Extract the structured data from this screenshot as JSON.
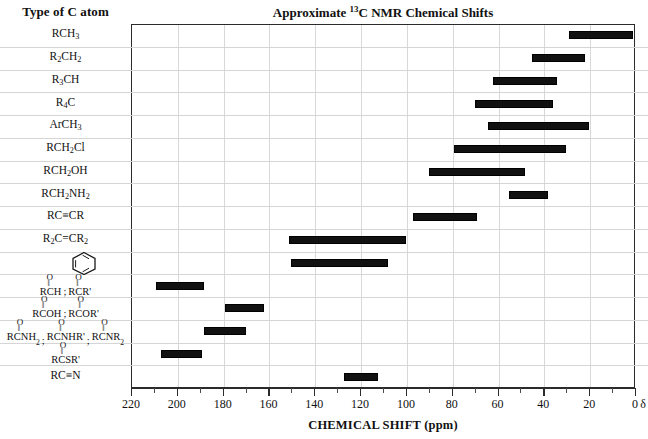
{
  "header": {
    "left_column_title": "Type of C atom",
    "chart_title_pre": "Approximate ",
    "chart_title_sup": "13",
    "chart_title_post": "C NMR Chemical Shifts"
  },
  "axis": {
    "title": "CHEMICAL SHIFT (ppm)",
    "delta_symbol": "δ",
    "major_ticks": [
      220,
      200,
      180,
      160,
      140,
      120,
      100,
      80,
      60,
      40,
      20,
      0
    ],
    "minor_ticks": [
      210,
      190,
      170,
      150,
      130,
      110,
      90,
      70,
      50,
      30,
      10
    ],
    "min": 0,
    "max": 220,
    "reversed": true
  },
  "colors": {
    "bar": "#111111",
    "frame": "#2b2b2b",
    "grid": "#d8d8d8",
    "rowline": "#d5d5d5",
    "background": "#ffffff"
  },
  "chart_data": {
    "type": "bar",
    "title": "Approximate 13C NMR Chemical Shifts",
    "xlabel": "CHEMICAL SHIFT (ppm)",
    "ylabel": "Type of C atom",
    "xlim": [
      220,
      0
    ],
    "grid": true,
    "orientation": "horizontal-ranges",
    "note": "Each row is a horizontal range bar spanning a chemical-shift interval in ppm",
    "categories": [
      "RCH3",
      "R2CH2",
      "R3CH",
      "R4C",
      "ArCH3",
      "RCH2Cl",
      "RCH2OH",
      "RCH2NH2",
      "RC≡CR",
      "R2C=CR2",
      "benzene-ring",
      "RCHO / RCOR' (aldehyde, ketone)",
      "RCOOH / RCOOR' (acid, ester)",
      "RCONH2 / RCONHR' / RCONR2 (amide)",
      "RCOSR' (thioester)",
      "RC≡N"
    ],
    "ranges": [
      {
        "label": "RCH3",
        "from": 1,
        "to": 29
      },
      {
        "label": "R2CH2",
        "from": 22,
        "to": 45
      },
      {
        "label": "R3CH",
        "from": 34,
        "to": 62
      },
      {
        "label": "R4C",
        "from": 36,
        "to": 70
      },
      {
        "label": "ArCH3",
        "from": 20,
        "to": 64
      },
      {
        "label": "RCH2Cl",
        "from": 30,
        "to": 79
      },
      {
        "label": "RCH2OH",
        "from": 48,
        "to": 90
      },
      {
        "label": "RCH2NH2",
        "from": 38,
        "to": 55
      },
      {
        "label": "RC≡CR",
        "from": 69,
        "to": 97
      },
      {
        "label": "R2C=CR2",
        "from": 100,
        "to": 151
      },
      {
        "label": "benzene-ring",
        "from": 108,
        "to": 150
      },
      {
        "label": "aldehyde-ketone",
        "from": 188,
        "to": 209
      },
      {
        "label": "acid-ester",
        "from": 162,
        "to": 179
      },
      {
        "label": "amide",
        "from": 170,
        "to": 188
      },
      {
        "label": "thioester",
        "from": 189,
        "to": 207
      },
      {
        "label": "nitrile",
        "from": 112,
        "to": 127
      }
    ]
  },
  "rows": [
    {
      "name": "rch3",
      "kind": "simple",
      "parts": [
        {
          "t": "RCH"
        },
        {
          "t": "3",
          "sub": true
        }
      ]
    },
    {
      "name": "r2ch2",
      "kind": "simple",
      "parts": [
        {
          "t": "R"
        },
        {
          "t": "2",
          "sub": true
        },
        {
          "t": "CH"
        },
        {
          "t": "2",
          "sub": true
        }
      ]
    },
    {
      "name": "r3ch",
      "kind": "simple",
      "parts": [
        {
          "t": "R"
        },
        {
          "t": "3",
          "sub": true
        },
        {
          "t": "CH"
        }
      ]
    },
    {
      "name": "r4c",
      "kind": "simple",
      "parts": [
        {
          "t": "R"
        },
        {
          "t": "4",
          "sub": true
        },
        {
          "t": "C"
        }
      ]
    },
    {
      "name": "arch3",
      "kind": "simple",
      "parts": [
        {
          "t": "ArCH"
        },
        {
          "t": "3",
          "sub": true
        }
      ]
    },
    {
      "name": "rch2cl",
      "kind": "simple",
      "parts": [
        {
          "t": "RCH"
        },
        {
          "t": "2",
          "sub": true
        },
        {
          "t": "Cl"
        }
      ]
    },
    {
      "name": "rch2oh",
      "kind": "simple",
      "parts": [
        {
          "t": "RCH"
        },
        {
          "t": "2",
          "sub": true
        },
        {
          "t": "OH"
        }
      ]
    },
    {
      "name": "rch2nh2",
      "kind": "simple",
      "parts": [
        {
          "t": "RCH"
        },
        {
          "t": "2",
          "sub": true
        },
        {
          "t": "NH"
        },
        {
          "t": "2",
          "sub": true
        }
      ]
    },
    {
      "name": "alkyne",
      "kind": "simple",
      "parts": [
        {
          "t": "RC≡CR"
        }
      ]
    },
    {
      "name": "alkene",
      "kind": "simple",
      "parts": [
        {
          "t": "R"
        },
        {
          "t": "2",
          "sub": true
        },
        {
          "t": "C=CR"
        },
        {
          "t": "2",
          "sub": true
        }
      ]
    },
    {
      "name": "benzene",
      "kind": "ring",
      "parts": []
    },
    {
      "name": "aldehyde-ketone",
      "kind": "carbonyl",
      "groups": [
        "RCH",
        "RCR'"
      ],
      "seps": [
        ";"
      ]
    },
    {
      "name": "acid-ester",
      "kind": "carbonyl",
      "groups": [
        "RCOH",
        "RCOR'"
      ],
      "seps": [
        ";"
      ]
    },
    {
      "name": "amide",
      "kind": "carbonyl",
      "groups": [
        "RCNH2",
        "RCNHR'",
        "RCNR2"
      ],
      "seps": [
        ";",
        ";"
      ]
    },
    {
      "name": "thioester",
      "kind": "carbonyl",
      "groups": [
        "RCSR'"
      ],
      "seps": []
    },
    {
      "name": "nitrile",
      "kind": "simple",
      "parts": [
        {
          "t": "RC≡N"
        }
      ]
    }
  ]
}
